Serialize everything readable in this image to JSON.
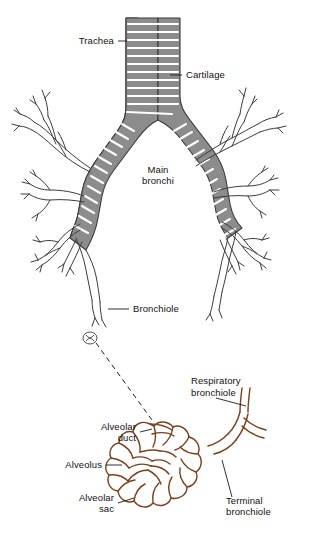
{
  "figure": {
    "background_color": "#ffffff",
    "colors": {
      "outline": "#3b3b3b",
      "cartilage_fill": "#8c8c8c",
      "alveolar_outline": "#7b3f1d",
      "leader_line": "#1a1a1a"
    },
    "labels": {
      "trachea": "Trachea",
      "cartilage": "Cartilage",
      "main_bronchi_line1": "Main",
      "main_bronchi_line2": "bronchi",
      "bronchiole": "Bronchiole",
      "respiratory_bronchiole_line1": "Respiratory",
      "respiratory_bronchiole_line2": "bronchiole",
      "alveolar_duct_line1": "Alveolar",
      "alveolar_duct_line2": "duct",
      "alveolus": "Alveolus",
      "alveolar_sac_line1": "Alveolar",
      "alveolar_sac_line2": "sac",
      "terminal_bronchiole_line1": "Terminal",
      "terminal_bronchiole_line2": "bronchiole"
    }
  }
}
